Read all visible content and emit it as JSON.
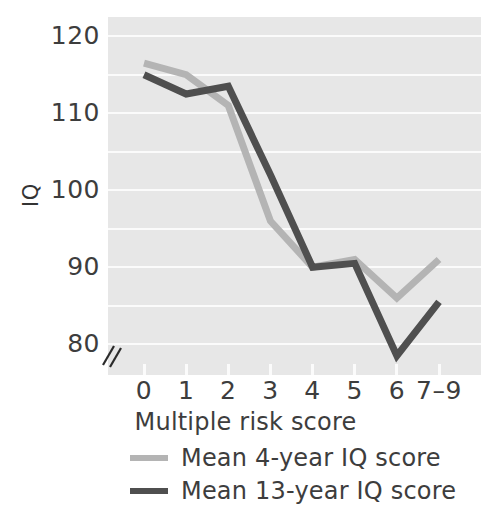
{
  "chart_data": {
    "type": "line",
    "title": "",
    "xlabel": "Multiple risk score",
    "ylabel": "IQ",
    "categories": [
      "0",
      "1",
      "2",
      "3",
      "4",
      "5",
      "6",
      "7–9"
    ],
    "ylim": [
      76,
      122.5
    ],
    "y_ticks": [
      120,
      110,
      100,
      90,
      80
    ],
    "y_gridlines": [
      120,
      115,
      110,
      105,
      100,
      95,
      90,
      85,
      80
    ],
    "grid": "horizontal-white",
    "y_axis_break": true,
    "legend_position": "below-axis-left",
    "series": [
      {
        "name": "Mean 4-year IQ score",
        "color": "#b4b4b4",
        "values": [
          116.5,
          115,
          111,
          96,
          90,
          91,
          86,
          91
        ]
      },
      {
        "name": "Mean 13-year IQ score",
        "color": "#4f4f4f",
        "values": [
          115,
          112.5,
          113.5,
          102,
          90,
          90.5,
          78.5,
          85.5
        ]
      }
    ]
  },
  "axes": {
    "y_title": "IQ",
    "y_tick_labels": [
      "120",
      "110",
      "100",
      "90",
      "80"
    ],
    "x_tick_labels": [
      "0",
      "1",
      "2",
      "3",
      "4",
      "5",
      "6",
      "7–9"
    ],
    "x_title": "Multiple risk score"
  },
  "legend": {
    "items": [
      {
        "label": "Mean 4-year IQ score",
        "color": "#b4b4b4"
      },
      {
        "label": "Mean 13-year IQ score",
        "color": "#4f4f4f"
      }
    ]
  },
  "colors": {
    "plot_background": "#e7e7e7",
    "gridline": "#fbfbfb",
    "series_light": "#b4b4b4",
    "series_dark": "#4f4f4f",
    "text": "#3d3d3d"
  }
}
